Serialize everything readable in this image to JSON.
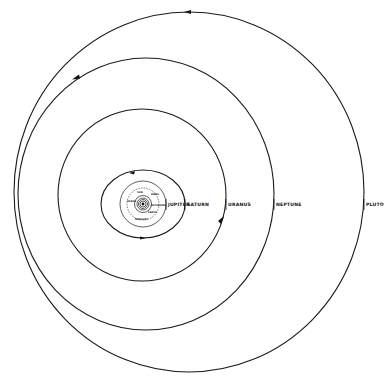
{
  "diagram": {
    "background": "#ffffff",
    "line_color": "#1a1a1a",
    "outer_labels": [
      {
        "id": "jupiter",
        "text": "JUPITER"
      },
      {
        "id": "saturn",
        "text": "SATURN"
      },
      {
        "id": "uranus",
        "text": "URANUS"
      },
      {
        "id": "neptune",
        "text": "NEPTUNE"
      },
      {
        "id": "pluto",
        "text": "PLUTO"
      }
    ],
    "inner_labels": [
      {
        "id": "sun",
        "text": "SUN"
      },
      {
        "id": "mercury",
        "text": "MERCURY"
      },
      {
        "id": "venus",
        "text": "VENUS"
      },
      {
        "id": "earth",
        "text": "EARTH"
      },
      {
        "id": "mars",
        "text": "MARS"
      },
      {
        "id": "asteroids",
        "text": "ASTEROIDS"
      }
    ],
    "orbits": [
      {
        "name": "Mercury",
        "cx": 143,
        "cy": 204,
        "rx": 3,
        "ry": 3
      },
      {
        "name": "Venus",
        "cx": 143,
        "cy": 204,
        "rx": 4.5,
        "ry": 4.5
      },
      {
        "name": "Earth",
        "cx": 143,
        "cy": 204,
        "rx": 6,
        "ry": 6
      },
      {
        "name": "Mars",
        "cx": 143,
        "cy": 204,
        "rx": 8.5,
        "ry": 8.5
      },
      {
        "name": "Asteroids",
        "cx": 143,
        "cy": 204,
        "rx": 16,
        "ry": 16
      },
      {
        "name": "Jupiter",
        "cx": 143,
        "cy": 204,
        "rx": 23,
        "ry": 23
      },
      {
        "name": "Saturn",
        "cx": 143,
        "cy": 204,
        "rx": 42,
        "ry": 34
      },
      {
        "name": "Uranus",
        "cx": 142,
        "cy": 196,
        "rx": 84,
        "ry": 86
      },
      {
        "name": "Neptune",
        "cx": 145,
        "cy": 194,
        "rx": 128,
        "ry": 136
      },
      {
        "name": "Pluto",
        "cx": 189,
        "cy": 192,
        "rx": 176,
        "ry": 180
      }
    ]
  }
}
